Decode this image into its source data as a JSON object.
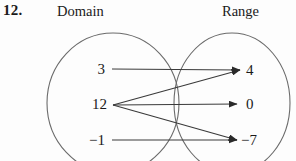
{
  "exercise": {
    "number": "12."
  },
  "headings": {
    "domain": "Domain",
    "range": "Range"
  },
  "colors": {
    "ink": "#1a1a1a",
    "stroke": "#3a3a3a",
    "ellipse": "#6b6b6b",
    "background": "#fdfdfd"
  },
  "diagram": {
    "type": "mapping-diagram",
    "domain_values": [
      "3",
      "12",
      "-1"
    ],
    "range_values": [
      "4",
      "0",
      "-7"
    ],
    "domain_display": [
      "3",
      "12",
      "−1"
    ],
    "range_display": [
      "4",
      "0",
      "−7"
    ],
    "mappings": [
      {
        "from": "3",
        "to": "4"
      },
      {
        "from": "12",
        "to": "4"
      },
      {
        "from": "12",
        "to": "0"
      },
      {
        "from": "12",
        "to": "-7"
      },
      {
        "from": "-1",
        "to": "-7"
      }
    ],
    "is_function": false
  },
  "nodes": {
    "domain": [
      {
        "id": "d0",
        "display": "3",
        "x": 105,
        "y": 69,
        "anchor_x": 112,
        "anchor_y": 69
      },
      {
        "id": "d1",
        "display": "12",
        "x": 107,
        "y": 104,
        "anchor_x": 113,
        "anchor_y": 105
      },
      {
        "id": "d2",
        "display": "−1",
        "x": 105,
        "y": 140,
        "anchor_x": 112,
        "anchor_y": 140
      }
    ],
    "range": [
      {
        "id": "r0",
        "display": "4",
        "x": 246,
        "y": 70,
        "anchor_x": 240,
        "anchor_y": 70
      },
      {
        "id": "r1",
        "display": "0",
        "x": 246,
        "y": 104,
        "anchor_x": 237,
        "anchor_y": 104
      },
      {
        "id": "r2",
        "display": "−7",
        "x": 241,
        "y": 140,
        "anchor_x": 237,
        "anchor_y": 140
      }
    ]
  },
  "ellipses": {
    "domain": {
      "cx": 113,
      "cy": 103,
      "rx": 66,
      "ry": 70
    },
    "range": {
      "cx": 232,
      "cy": 103,
      "rx": 58,
      "ry": 70
    }
  }
}
